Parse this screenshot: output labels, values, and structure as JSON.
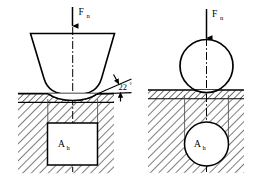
{
  "figure": {
    "width": 259,
    "height": 180,
    "background": "#ffffff",
    "line_color": "#000000",
    "hatch_color": "#000000"
  },
  "panels": [
    {
      "id": "left",
      "name": "conical-indenter-panel",
      "indenter_type": "conical",
      "force_label": "F",
      "force_subscript": "n",
      "angle_label": "22",
      "angle_degree_symbol": "°",
      "area_label": "A",
      "area_subscript": "h",
      "area_shape": "square"
    },
    {
      "id": "right",
      "name": "spherical-indenter-panel",
      "indenter_type": "spherical",
      "force_label": "F",
      "force_subscript": "n",
      "area_label": "A",
      "area_subscript": "h",
      "area_shape": "circle"
    }
  ],
  "annotations": {
    "normal_force": "F",
    "normal_force_sub": "n",
    "projected_area": "A",
    "projected_area_sub": "h",
    "cone_angle": "22",
    "degree": "°"
  }
}
